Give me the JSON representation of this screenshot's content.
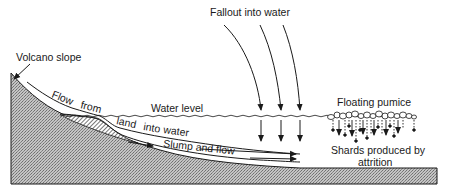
{
  "diagram": {
    "labels": {
      "volcano_slope": "Volcano slope",
      "fallout": "Fallout into water",
      "water_level": "Water level",
      "flow_words": [
        "Flow",
        "from",
        "land",
        "into",
        "water"
      ],
      "slump": "Slump and flow",
      "floating_pumice": "Floating pumice",
      "shards_line1": "Shards produced by",
      "shards_line2": "attrition"
    },
    "colors": {
      "ink": "#1a1a1a",
      "ground_fill": "#b8b8b8",
      "background": "#ffffff"
    }
  }
}
